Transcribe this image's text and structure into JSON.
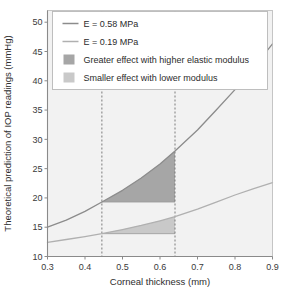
{
  "chart_data": {
    "type": "line",
    "title": "",
    "xlabel": "Corneal thickness (mm)",
    "ylabel": "Theoretical prediction of IOP readings (mmHg)",
    "xlim": [
      0.3,
      0.9
    ],
    "ylim": [
      10,
      52
    ],
    "xticks": [
      "0.3",
      "0.4",
      "0.5",
      "0.6",
      "0.7",
      "0.8",
      "0.9"
    ],
    "xtick_values": [
      0.3,
      0.4,
      0.5,
      0.6,
      0.7,
      0.8,
      0.9
    ],
    "yticks": [
      "10",
      "15",
      "20",
      "25",
      "30",
      "35",
      "40",
      "45",
      "50"
    ],
    "ytick_values": [
      10,
      15,
      20,
      25,
      30,
      35,
      40,
      45,
      50
    ],
    "grid": false,
    "legend_position": "top",
    "series": [
      {
        "name": "E = 0.58 MPa",
        "kind": "line",
        "color": "#8c8c8c",
        "x": [
          0.3,
          0.35,
          0.4,
          0.445,
          0.5,
          0.55,
          0.6,
          0.64,
          0.7,
          0.75,
          0.8,
          0.85,
          0.9
        ],
        "y": [
          15.0,
          16.2,
          17.7,
          19.3,
          21.3,
          23.4,
          25.8,
          28.0,
          31.6,
          35.0,
          38.5,
          42.3,
          46.3
        ]
      },
      {
        "name": "E = 0.19 MPa",
        "kind": "line",
        "color": "#b0b0b0",
        "x": [
          0.3,
          0.35,
          0.4,
          0.445,
          0.5,
          0.55,
          0.6,
          0.64,
          0.7,
          0.75,
          0.8,
          0.85,
          0.9
        ],
        "y": [
          12.4,
          12.9,
          13.4,
          13.9,
          14.6,
          15.3,
          16.1,
          16.8,
          18.1,
          19.3,
          20.5,
          21.6,
          22.6
        ]
      }
    ],
    "shaded_regions": [
      {
        "name": "Greater effect with higher elastic modulus",
        "color": "#a6a6a6",
        "series_ref": "E = 0.58 MPa",
        "x_from": 0.445,
        "x_to": 0.64,
        "baseline_y": 19.3,
        "top_y": 28.0
      },
      {
        "name": "Smaller effect with lower modulus",
        "color": "#c9c9c9",
        "series_ref": "E = 0.19 MPa",
        "x_from": 0.445,
        "x_to": 0.64,
        "baseline_y": 13.9,
        "top_y": 16.8
      }
    ],
    "reference_lines": [
      {
        "name": "left-reference-line",
        "orientation": "vertical",
        "x": 0.445,
        "style": "dashed"
      },
      {
        "name": "right-reference-line",
        "orientation": "vertical",
        "x": 0.64,
        "style": "dashed"
      }
    ],
    "legend": [
      {
        "label": "E = 0.58 MPa",
        "marker": "line",
        "color": "#8c8c8c"
      },
      {
        "label": "E = 0.19 MPa",
        "marker": "line",
        "color": "#b0b0b0"
      },
      {
        "label": "Greater effect with higher elastic modulus",
        "marker": "swatch",
        "color": "#a6a6a6"
      },
      {
        "label": "Smaller effect with lower modulus",
        "marker": "swatch",
        "color": "#c9c9c9"
      }
    ],
    "colors": {
      "plot_background": "#f2f2f2",
      "legend_background": "#ffffff",
      "legend_border": "#b8b8b8",
      "axis": "#8a8a8a",
      "text": "#2e2e2e"
    }
  }
}
